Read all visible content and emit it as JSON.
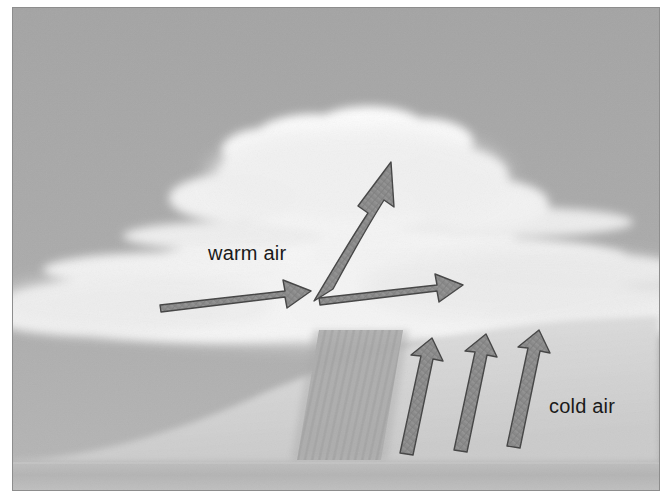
{
  "figure": {
    "width": 672,
    "height": 500,
    "background_color": "#ffffff",
    "frame_border_color": "#8d8d8d"
  },
  "scene": {
    "sky": {
      "name": "sky-background",
      "top_color": "#a6a6a6",
      "bottom_color": "#b4b4b4"
    },
    "ground": {
      "name": "ground-surface",
      "color": "#b9b9b9",
      "top_y": 464,
      "bottom_y": 490
    },
    "frontal_wedge": {
      "name": "warm-front-surface",
      "color": "#d3d3d3",
      "description": "curved sloping frontal boundary rising from lower left"
    },
    "clouds": {
      "name": "cloud-mass",
      "color": "#f7f7f7",
      "description": "layered stratiform and towering cumulus cloud deck"
    },
    "precipitation": {
      "name": "precipitation-band",
      "color": "#a8a8a8",
      "description": "slanted hatched band of falling precipitation"
    }
  },
  "labels": {
    "warm_air": "warm air",
    "cold_air": "cold air",
    "text_color": "#1a1a1a",
    "font_size_px": 20
  },
  "arrows": {
    "fill_color": "#8c8c8c",
    "stroke_color": "#3f3f3f",
    "warm_air_flow": [
      {
        "name": "warm-air-arrow-left",
        "direction": "right",
        "label_group": "warm air"
      },
      {
        "name": "warm-air-arrow-middle",
        "direction": "right",
        "label_group": "warm air"
      },
      {
        "name": "warm-air-arrow-rising",
        "direction": "up-right-curved",
        "label_group": "warm air"
      }
    ],
    "cold_air_flow": [
      {
        "name": "cold-air-arrow-1",
        "direction": "up",
        "label_group": "cold air"
      },
      {
        "name": "cold-air-arrow-2",
        "direction": "up",
        "label_group": "cold air"
      },
      {
        "name": "cold-air-arrow-3",
        "direction": "up",
        "label_group": "cold air"
      }
    ]
  }
}
